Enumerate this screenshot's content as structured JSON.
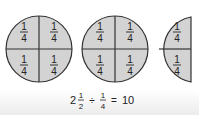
{
  "diagram": {
    "fill_color": "#d3d3d3",
    "stroke_color": "#333333",
    "wholes": [
      {
        "pieces": [
          "1/4",
          "1/4",
          "1/4",
          "1/4"
        ]
      },
      {
        "pieces": [
          "1/4",
          "1/4",
          "1/4",
          "1/4"
        ]
      }
    ],
    "half": {
      "pieces": [
        "1/4",
        "1/4"
      ]
    },
    "fraction": {
      "numerator": "1",
      "denominator": "4"
    }
  },
  "equation": {
    "whole": "2",
    "mixed_num": "1",
    "mixed_den": "2",
    "op": "÷",
    "div_num": "1",
    "div_den": "4",
    "equals": "=",
    "result": "10"
  }
}
